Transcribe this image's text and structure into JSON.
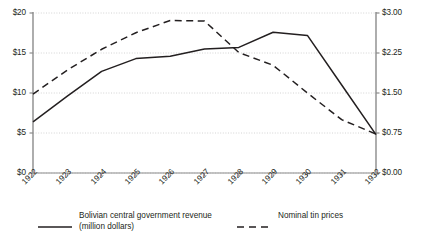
{
  "chart_data": {
    "type": "line",
    "title": "",
    "subtitle": "",
    "xlabel": "",
    "ylabel": "",
    "ylabel_right": "",
    "grid": true,
    "legend_position": "bottom",
    "categories": [
      "1922",
      "1923",
      "1924",
      "1925",
      "1926",
      "1927",
      "1928",
      "1929",
      "1930",
      "1931",
      "1932"
    ],
    "x": [
      1922,
      1923,
      1924,
      1925,
      1926,
      1927,
      1928,
      1929,
      1930,
      1931,
      1932
    ],
    "ylim": [
      0,
      20
    ],
    "ylim_right": [
      0,
      3.0
    ],
    "yticks": [
      "$0",
      "$5",
      "$10",
      "$15",
      "$20"
    ],
    "ytick_values": [
      0,
      5,
      10,
      15,
      20
    ],
    "yticks_right": [
      "$0.00",
      "$0.75",
      "$1.50",
      "$2.25",
      "$3.00"
    ],
    "ytick_values_right": [
      0,
      0.75,
      1.5,
      2.25,
      3.0
    ],
    "series": [
      {
        "name": "Bolivian central government revenue (million dollars)",
        "axis": "left",
        "style": "solid",
        "color": "#231f20",
        "values": [
          6.4,
          9.6,
          12.7,
          14.3,
          14.6,
          15.5,
          15.7,
          17.6,
          17.2,
          11.0,
          4.8
        ]
      },
      {
        "name": "Nominal tin prices",
        "axis": "right",
        "style": "dashed",
        "color": "#231f20",
        "values": [
          1.48,
          1.93,
          2.32,
          2.63,
          2.86,
          2.85,
          2.26,
          2.02,
          1.5,
          1.0,
          0.73
        ]
      }
    ]
  },
  "legend": {
    "items": [
      {
        "label_line1": "Bolivian central government revenue",
        "label_line2": "(million dollars)",
        "style": "solid"
      },
      {
        "label_line1": "Nominal tin prices",
        "label_line2": "",
        "style": "dashed"
      }
    ]
  },
  "colors": {
    "ink": "#231f20",
    "axis": "#8b8b8b",
    "grid": "#c9c9c9"
  }
}
